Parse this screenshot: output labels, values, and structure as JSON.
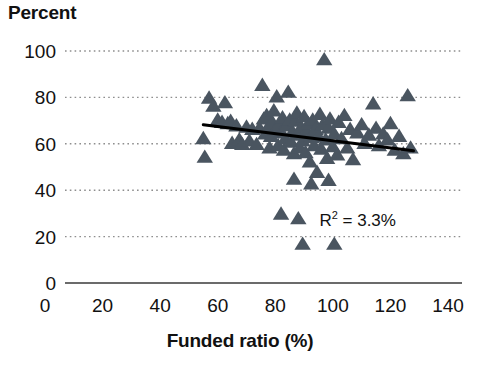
{
  "chart_data": {
    "type": "scatter",
    "title": "",
    "ylabel": "Percent",
    "xlabel": "Funded ratio (%)",
    "xlim": [
      0,
      140
    ],
    "ylim": [
      0,
      100
    ],
    "xticks": [
      0,
      20,
      40,
      60,
      80,
      100,
      120,
      140
    ],
    "yticks": [
      0,
      20,
      40,
      60,
      80,
      100
    ],
    "grid": "horizontal-dotted",
    "legend": "none",
    "marker_shape": "triangle",
    "marker_color": "#4a5560",
    "annotations": [
      {
        "name": "r-squared",
        "text_prefix": "R",
        "text_sup": "2",
        "text_suffix": " = 3.3%",
        "full_text": "R2 = 3.3%",
        "x": 112,
        "y": 27
      }
    ],
    "trendline": {
      "color": "#000000",
      "x_start": 55,
      "y_start": 68.2,
      "x_end": 128,
      "y_end": 57.0
    },
    "points": [
      {
        "x": 55.0,
        "y": 62.0
      },
      {
        "x": 55.5,
        "y": 54.0
      },
      {
        "x": 57.0,
        "y": 79.5
      },
      {
        "x": 58.5,
        "y": 76.0
      },
      {
        "x": 60.0,
        "y": 70.0
      },
      {
        "x": 61.5,
        "y": 69.0
      },
      {
        "x": 62.5,
        "y": 77.5
      },
      {
        "x": 63.5,
        "y": 68.5
      },
      {
        "x": 64.5,
        "y": 69.5
      },
      {
        "x": 65.0,
        "y": 60.0
      },
      {
        "x": 66.5,
        "y": 67.5
      },
      {
        "x": 67.5,
        "y": 61.5
      },
      {
        "x": 68.5,
        "y": 59.5
      },
      {
        "x": 70.0,
        "y": 67.0
      },
      {
        "x": 71.0,
        "y": 61.0
      },
      {
        "x": 72.0,
        "y": 66.0
      },
      {
        "x": 73.5,
        "y": 59.5
      },
      {
        "x": 74.5,
        "y": 66.5
      },
      {
        "x": 75.5,
        "y": 85.0
      },
      {
        "x": 76.0,
        "y": 70.5
      },
      {
        "x": 76.5,
        "y": 64.0
      },
      {
        "x": 77.0,
        "y": 72.0
      },
      {
        "x": 77.5,
        "y": 67.0
      },
      {
        "x": 78.0,
        "y": 58.0
      },
      {
        "x": 78.5,
        "y": 63.0
      },
      {
        "x": 79.0,
        "y": 69.0
      },
      {
        "x": 79.5,
        "y": 74.0
      },
      {
        "x": 80.0,
        "y": 66.0
      },
      {
        "x": 80.5,
        "y": 80.0
      },
      {
        "x": 81.0,
        "y": 59.0
      },
      {
        "x": 81.5,
        "y": 68.0
      },
      {
        "x": 82.0,
        "y": 64.5
      },
      {
        "x": 82.5,
        "y": 71.0
      },
      {
        "x": 83.0,
        "y": 57.0
      },
      {
        "x": 83.5,
        "y": 62.0
      },
      {
        "x": 84.0,
        "y": 67.5
      },
      {
        "x": 84.5,
        "y": 82.0
      },
      {
        "x": 85.0,
        "y": 70.0
      },
      {
        "x": 85.5,
        "y": 60.5
      },
      {
        "x": 86.0,
        "y": 65.0
      },
      {
        "x": 86.5,
        "y": 55.5
      },
      {
        "x": 87.0,
        "y": 69.5
      },
      {
        "x": 87.5,
        "y": 73.0
      },
      {
        "x": 88.0,
        "y": 63.5
      },
      {
        "x": 88.5,
        "y": 58.0
      },
      {
        "x": 89.0,
        "y": 67.0
      },
      {
        "x": 89.5,
        "y": 61.0
      },
      {
        "x": 90.0,
        "y": 71.5
      },
      {
        "x": 90.5,
        "y": 56.0
      },
      {
        "x": 91.0,
        "y": 65.5
      },
      {
        "x": 91.5,
        "y": 68.5
      },
      {
        "x": 92.0,
        "y": 52.0
      },
      {
        "x": 92.5,
        "y": 62.5
      },
      {
        "x": 93.0,
        "y": 70.0
      },
      {
        "x": 93.5,
        "y": 59.0
      },
      {
        "x": 94.0,
        "y": 66.0
      },
      {
        "x": 94.5,
        "y": 47.5
      },
      {
        "x": 95.0,
        "y": 63.0
      },
      {
        "x": 95.5,
        "y": 72.5
      },
      {
        "x": 96.0,
        "y": 57.5
      },
      {
        "x": 96.5,
        "y": 68.0
      },
      {
        "x": 97.0,
        "y": 96.0
      },
      {
        "x": 97.5,
        "y": 61.5
      },
      {
        "x": 98.0,
        "y": 53.5
      },
      {
        "x": 98.5,
        "y": 66.5
      },
      {
        "x": 99.0,
        "y": 70.5
      },
      {
        "x": 100.0,
        "y": 58.5
      },
      {
        "x": 100.5,
        "y": 64.0
      },
      {
        "x": 101.5,
        "y": 55.0
      },
      {
        "x": 102.0,
        "y": 69.0
      },
      {
        "x": 103.0,
        "y": 62.0
      },
      {
        "x": 104.0,
        "y": 72.0
      },
      {
        "x": 105.0,
        "y": 58.0
      },
      {
        "x": 106.0,
        "y": 66.0
      },
      {
        "x": 107.0,
        "y": 53.0
      },
      {
        "x": 108.5,
        "y": 64.5
      },
      {
        "x": 110.0,
        "y": 68.0
      },
      {
        "x": 111.0,
        "y": 60.0
      },
      {
        "x": 112.5,
        "y": 63.5
      },
      {
        "x": 114.0,
        "y": 77.0
      },
      {
        "x": 115.0,
        "y": 66.5
      },
      {
        "x": 116.0,
        "y": 59.0
      },
      {
        "x": 117.5,
        "y": 64.0
      },
      {
        "x": 119.0,
        "y": 61.5
      },
      {
        "x": 120.0,
        "y": 68.5
      },
      {
        "x": 121.5,
        "y": 57.0
      },
      {
        "x": 123.0,
        "y": 63.0
      },
      {
        "x": 124.5,
        "y": 55.5
      },
      {
        "x": 126.0,
        "y": 80.5
      },
      {
        "x": 127.0,
        "y": 58.0
      },
      {
        "x": 82.0,
        "y": 29.5
      },
      {
        "x": 88.0,
        "y": 27.5
      },
      {
        "x": 89.5,
        "y": 16.5
      },
      {
        "x": 100.5,
        "y": 16.5
      },
      {
        "x": 86.5,
        "y": 44.5
      },
      {
        "x": 92.5,
        "y": 42.5
      },
      {
        "x": 98.5,
        "y": 44.0
      }
    ]
  }
}
